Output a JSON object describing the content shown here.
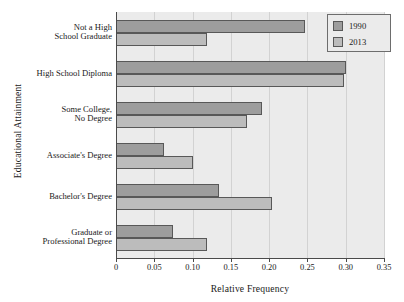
{
  "chart_data": {
    "type": "bar",
    "orientation": "horizontal",
    "title": "",
    "xlabel": "Relative Frequency",
    "ylabel": "Educational Attainment",
    "xlim": [
      0,
      0.35
    ],
    "xticks": [
      "0",
      "0.05",
      "0.10",
      "0.15",
      "0.20",
      "0.25",
      "0.30",
      "0.35"
    ],
    "xtick_values": [
      0,
      0.05,
      0.1,
      0.15,
      0.2,
      0.25,
      0.3,
      0.35
    ],
    "grid": "vertical",
    "legend_position": "top-right",
    "categories": [
      "Not a High School Graduate",
      "High School Diploma",
      "Some College, No Degree",
      "Associate's Degree",
      "Bachelor's Degree",
      "Graduate or Professional Degree"
    ],
    "category_lines": [
      [
        "Not a High",
        "School Graduate"
      ],
      [
        "High School Diploma"
      ],
      [
        "Some College,",
        "No Degree"
      ],
      [
        "Associate's Degree"
      ],
      [
        "Bachelor's Degree"
      ],
      [
        "Graduate or",
        "Professional Degree"
      ]
    ],
    "series": [
      {
        "name": "1990",
        "color": "#9d9d9d",
        "values": [
          0.247,
          0.301,
          0.191,
          0.063,
          0.134,
          0.075
        ]
      },
      {
        "name": "2013",
        "color": "#bcbcbc",
        "values": [
          0.119,
          0.298,
          0.171,
          0.101,
          0.204,
          0.119
        ]
      }
    ]
  },
  "legend": {
    "entries": [
      {
        "label": "1990"
      },
      {
        "label": "2013"
      }
    ]
  },
  "colors": {
    "plot_background": "#ebebeb",
    "gridline": "#d2d2d2",
    "axis": "#4a4a4a",
    "bar_edge": "#585858",
    "series_1990": "#9d9d9d",
    "series_2013": "#bcbcbc"
  }
}
